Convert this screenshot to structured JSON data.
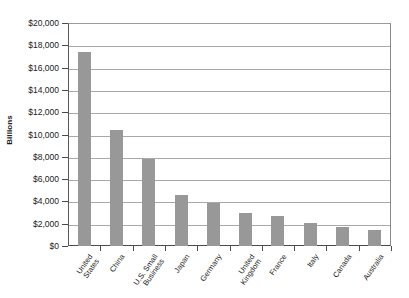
{
  "chart_data": {
    "type": "bar",
    "title": "",
    "xlabel": "",
    "ylabel": "Billions",
    "categories": [
      "United States",
      "China",
      "U.S. Small Business",
      "Japan",
      "Germany",
      "United Kingdom",
      "France",
      "Italy",
      "Canada",
      "Australia"
    ],
    "values": [
      17400,
      10400,
      7800,
      4600,
      3900,
      3000,
      2700,
      2100,
      1700,
      1400
    ],
    "ylim": [
      0,
      20000
    ],
    "ytick_values": [
      0,
      2000,
      4000,
      6000,
      8000,
      10000,
      12000,
      14000,
      16000,
      18000,
      20000
    ],
    "ytick_labels": [
      "$0",
      "$2,000",
      "$4,000",
      "$6,000",
      "$8,000",
      "$10,000",
      "$12,000",
      "$14,000",
      "$16,000",
      "$18,000",
      "$20,000"
    ],
    "grid": true,
    "legend": false,
    "bar_color": "#989898",
    "axis_color": "#4a4a4a",
    "gridline_color": "#a8a8a8",
    "background_color": "#ffffff"
  },
  "axis": {
    "y_title": "Billions"
  }
}
